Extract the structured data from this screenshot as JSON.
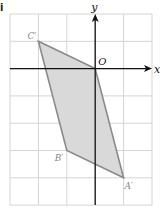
{
  "part_label": "i",
  "axes": {
    "x_label": "x",
    "y_label": "y",
    "origin_label": "O",
    "x_range": [
      -3,
      2
    ],
    "y_range": [
      -5,
      2
    ]
  },
  "grid": {
    "left_px": 10,
    "top_px": 14,
    "cell_w": 28.4,
    "cell_h": 27.3,
    "cols": 5,
    "rows": 7,
    "color": "#d4d4d4"
  },
  "shape": {
    "fill": "#d9d9d9",
    "stroke": "#8a8a8a",
    "vertices": [
      {
        "name": "C'",
        "x": -2,
        "y": 1
      },
      {
        "name": "O",
        "x": 0,
        "y": 0
      },
      {
        "name": "A'",
        "x": 1,
        "y": -4
      },
      {
        "name": "B'",
        "x": -1,
        "y": -3
      }
    ]
  },
  "vertex_labels": {
    "c": "C′",
    "b": "B′",
    "a": "A′"
  },
  "colors": {
    "axis": "#111111",
    "label": "#888888"
  }
}
